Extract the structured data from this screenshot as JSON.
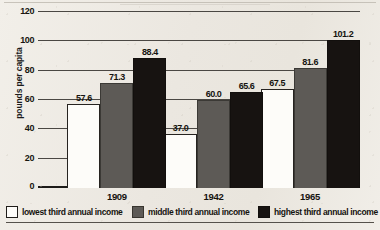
{
  "chart_data": {
    "type": "bar",
    "title": "",
    "xlabel": "",
    "ylabel": "pounds per capita",
    "categories": [
      "1909",
      "1942",
      "1965"
    ],
    "ylim": [
      0,
      120
    ],
    "yticks": [
      0,
      20,
      40,
      60,
      80,
      100,
      120
    ],
    "ytick_labels": [
      "0",
      "20",
      "40",
      "60",
      "80",
      "100",
      "120"
    ],
    "grid": true,
    "legend_position": "bottom",
    "series": [
      {
        "name": "lowest third annual income",
        "color": "#ffffff",
        "values": [
          57.6,
          71.3,
          88.4
        ],
        "labels": [
          "57.6",
          "71.3",
          "88.4"
        ]
      },
      {
        "name": "middle third annual income",
        "color": "#5d5a56",
        "values": [
          37.0,
          60.0,
          65.6
        ],
        "labels": [
          "37.0",
          "60.0",
          "65.6"
        ]
      },
      {
        "name": "highest third annual income",
        "color": "#171311",
        "values": [
          67.5,
          81.6,
          101.2
        ],
        "labels": [
          "67.5",
          "81.6",
          "101.2"
        ]
      }
    ],
    "groups": [
      {
        "category": "1909",
        "bars": [
          {
            "series": "lowest third annual income",
            "value": 57.6,
            "label": "57.6"
          },
          {
            "series": "middle third annual income",
            "value": 71.3,
            "label": "71.3"
          },
          {
            "series": "highest third annual income",
            "value": 88.4,
            "label": "88.4"
          }
        ]
      },
      {
        "category": "1942",
        "bars": [
          {
            "series": "lowest third annual income",
            "value": 37.0,
            "label": "37.0"
          },
          {
            "series": "middle third annual income",
            "value": 60.0,
            "label": "60.0"
          },
          {
            "series": "highest third annual income",
            "value": 65.6,
            "label": "65.6"
          }
        ]
      },
      {
        "category": "1965",
        "bars": [
          {
            "series": "lowest third annual income",
            "value": 67.5,
            "label": "67.5"
          },
          {
            "series": "middle third annual income",
            "value": 81.6,
            "label": "81.6"
          },
          {
            "series": "highest third annual income",
            "value": 101.2,
            "label": "101.2"
          }
        ]
      }
    ]
  },
  "legend": {
    "items": [
      {
        "label": "lowest third annual income"
      },
      {
        "label": "middle third annual income"
      },
      {
        "label": "highest third annual income"
      }
    ]
  }
}
